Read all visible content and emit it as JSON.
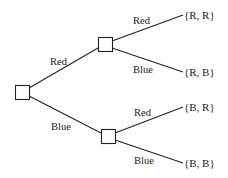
{
  "diagram": {
    "type": "probability-tree",
    "root": {
      "id": "root"
    },
    "stage1": [
      {
        "id": "node-red",
        "edge_label": "Red"
      },
      {
        "id": "node-blue",
        "edge_label": "Blue"
      }
    ],
    "stage2": [
      {
        "parent": "node-red",
        "edge_label": "Red",
        "outcome": "{R, R}"
      },
      {
        "parent": "node-red",
        "edge_label": "Blue",
        "outcome": "{R, B}"
      },
      {
        "parent": "node-blue",
        "edge_label": "Red",
        "outcome": "{B, R}"
      },
      {
        "parent": "node-blue",
        "edge_label": "Blue",
        "outcome": "{B, B}"
      }
    ]
  },
  "colors": {
    "line": "#222222",
    "background": "#ffffff"
  }
}
